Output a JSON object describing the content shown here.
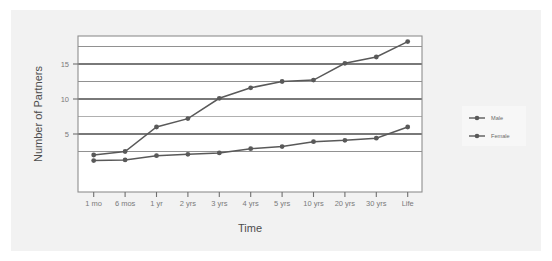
{
  "chart_data": {
    "type": "line",
    "title": "",
    "xlabel": "Time",
    "ylabel": "Number of Partners",
    "categories": [
      "1 mo",
      "6 mos",
      "1 yr",
      "2 yrs",
      "3 yrs",
      "4 yrs",
      "5 yrs",
      "10 yrs",
      "20 yrs",
      "30 yrs",
      "Life"
    ],
    "series": [
      {
        "name": "Male",
        "color": "#595959",
        "values": [
          2,
          2.5,
          6,
          7.2,
          10.1,
          11.6,
          12.5,
          12.7,
          15.1,
          16,
          18.2
        ]
      },
      {
        "name": "Female",
        "color": "#595959",
        "values": [
          1.2,
          1.3,
          1.9,
          2.1,
          2.3,
          2.9,
          3.2,
          3.9,
          4.1,
          4.4,
          6
        ]
      }
    ],
    "ytick_labels": [
      "5",
      "10",
      "15"
    ],
    "ytick_values": [
      5,
      10,
      15
    ],
    "ylim": [
      0,
      19
    ],
    "grid": true,
    "gridlines_major": [
      2.5,
      5,
      7.5,
      10,
      12.5,
      15,
      17.5
    ],
    "legend_position": "right",
    "legend_entries": [
      "Male",
      "Female"
    ]
  },
  "legend": {
    "entries": [
      {
        "label": "Male",
        "marker": "line-marker-icon"
      },
      {
        "label": "Female",
        "marker": "line-marker-icon"
      }
    ]
  },
  "axes": {
    "y_title": "Number of Partners",
    "x_title": "Time"
  },
  "colors": {
    "card_background": "#f2f2f2",
    "figure_background": "#ffffff",
    "line": "#595959",
    "grid_dark": "#4d4d4d",
    "grid_light": "#b3b3b3",
    "frame": "#808080",
    "tick_text": "#7a7a7a",
    "title_text": "#4d4d4d"
  }
}
